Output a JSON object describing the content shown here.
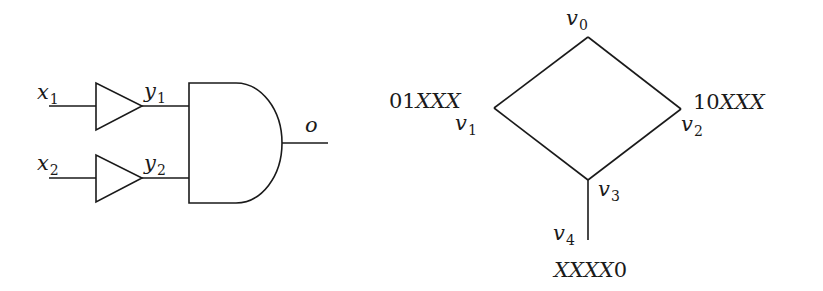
{
  "circuit": {
    "inputs": [
      {
        "var": "x",
        "sub": "1"
      },
      {
        "var": "x",
        "sub": "2"
      }
    ],
    "buffer_outputs": [
      {
        "var": "y",
        "sub": "1"
      },
      {
        "var": "y",
        "sub": "2"
      }
    ],
    "gate": "AND",
    "output": {
      "var": "o"
    }
  },
  "graph": {
    "nodes": [
      {
        "id": "v0",
        "var": "v",
        "sub": "0",
        "pattern": ""
      },
      {
        "id": "v1",
        "var": "v",
        "sub": "1",
        "pattern_num": "01",
        "pattern_x": "XXX"
      },
      {
        "id": "v2",
        "var": "v",
        "sub": "2",
        "pattern_num": "10",
        "pattern_x": "XXX"
      },
      {
        "id": "v3",
        "var": "v",
        "sub": "3",
        "pattern": ""
      },
      {
        "id": "v4",
        "var": "v",
        "sub": "4",
        "pattern_x": "XXXX",
        "pattern_num": "0"
      }
    ],
    "edges": [
      [
        "v0",
        "v1"
      ],
      [
        "v0",
        "v2"
      ],
      [
        "v1",
        "v3"
      ],
      [
        "v2",
        "v3"
      ],
      [
        "v3",
        "v4"
      ]
    ]
  }
}
